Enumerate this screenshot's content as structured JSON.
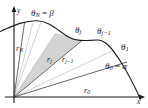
{
  "figure": {
    "type": "polar-sector-partition-diagram",
    "axes": {
      "x_label": "x",
      "y_label": "y",
      "origin": [
        14,
        97
      ],
      "x_axis_end": [
        144,
        97
      ],
      "y_axis_top": [
        14,
        8
      ]
    },
    "labels": {
      "theta_N": {
        "base": "θ",
        "sub": "N",
        "eq": " = ",
        "value": "β",
        "text": "θN = β",
        "x": 31,
        "y": 9
      },
      "theta_j": {
        "base": "θ",
        "sub": "j",
        "text": "θj",
        "x": 75,
        "y": 27
      },
      "theta_j_minus_1": {
        "base": "θ",
        "sub": "j−1",
        "text": "θj−1",
        "x": 98,
        "y": 28
      },
      "theta_1": {
        "base": "θ",
        "sub": "1",
        "text": "θ1",
        "x": 122,
        "y": 44
      },
      "theta_0": {
        "base": "θ",
        "sub": "0",
        "eq": " = ",
        "value": "α",
        "text": "θ0 = α",
        "x": 106,
        "y": 63
      },
      "r_N": {
        "base": "r",
        "sub": "N",
        "text": "rN",
        "x": 16,
        "y": 46
      },
      "r_j": {
        "base": "r",
        "sub": "j",
        "text": "rj",
        "x": 48,
        "y": 57
      },
      "r_j_minus_1": {
        "base": "r",
        "sub": "j−1",
        "text": "rj−1",
        "x": 63,
        "y": 57
      },
      "r_0": {
        "base": "r",
        "sub": "0",
        "text": "r0",
        "x": 84,
        "y": 88
      }
    },
    "colors": {
      "curve": "#1a1a1a",
      "axis": "#1a1a1a",
      "ray_solid": "#4a4a4a",
      "ray_light": "#b8b8b8",
      "wedge_fill": "#d0d0d0",
      "text": "#1a1a1a",
      "background": "#ffffff"
    },
    "geometry": {
      "curve_path": "M 0,31 C 10,28 22,21 38,21 C 52,21 60,33 70,38 C 80,43 88,40 97,40 C 106,40 112,48 120,60 C 128,72 134,85 140,97",
      "rays": [
        {
          "name": "ray-theta-N",
          "angle_deg": 82,
          "to": [
            24,
            23
          ],
          "style": "solid"
        },
        {
          "name": "ray-a",
          "angle_deg": 74,
          "to": [
            32,
            23
          ],
          "style": "light"
        },
        {
          "name": "ray-b",
          "angle_deg": 68,
          "to": [
            40,
            22
          ],
          "style": "light"
        },
        {
          "name": "ray-theta-j",
          "angle_deg": 56,
          "to": [
            55,
            33
          ],
          "style": "light"
        },
        {
          "name": "ray-theta-j-minus-1",
          "angle_deg": 45,
          "to": [
            82,
            40
          ],
          "style": "solid"
        },
        {
          "name": "ray-theta-1",
          "angle_deg": 26,
          "to": [
            112,
            50
          ],
          "style": "light"
        },
        {
          "name": "ray-theta-0",
          "angle_deg": 18,
          "to": [
            126,
            62
          ],
          "style": "solid"
        }
      ],
      "wedge_polygon": "14,97 55,33 82,40",
      "arrow_heads": [
        "y-axis-arrow",
        "x-axis-arrow"
      ]
    }
  }
}
